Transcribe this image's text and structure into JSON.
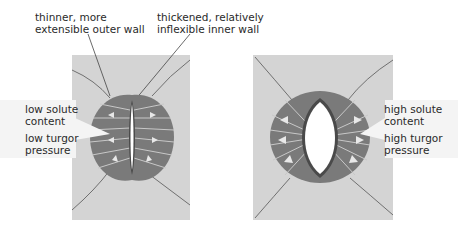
{
  "labels": {
    "outer_wall": [
      "thinner, more",
      "extensible outer wall"
    ],
    "inner_wall": [
      "thickened, relatively",
      "inflexible inner wall"
    ],
    "left_solute": [
      "low solute",
      "content"
    ],
    "left_turgor": [
      "low turgor",
      "pressure"
    ],
    "right_solute": [
      "high solute",
      "content"
    ],
    "right_turgor": [
      "high turgor",
      "pressure"
    ]
  },
  "states": [
    {
      "name": "closed stoma",
      "solute": "low",
      "turgor": "low"
    },
    {
      "name": "open stoma",
      "solute": "high",
      "turgor": "high"
    }
  ],
  "colors": {
    "background_tile": "#d4d4d4",
    "guard_cell": "#7a7a7a",
    "inner_wall": "#4a4a4a",
    "radial_lines": "#c8c8c8",
    "pore": "#ffffff",
    "label_box": "#f4f4f4"
  }
}
